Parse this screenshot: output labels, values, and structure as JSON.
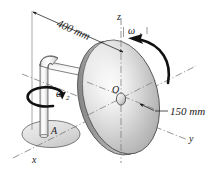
{
  "figure": {
    "dimensions": {
      "arm_length": "400 mm",
      "disk_radius": "150 mm"
    },
    "angular_velocities": {
      "disk_spin": "ω",
      "disk_spin_sub": "1",
      "shaft_spin": "ω",
      "shaft_spin_sub": "2"
    },
    "points": {
      "disk_center": "O",
      "base_point": "A"
    },
    "axes": {
      "x": "x",
      "y": "y",
      "z": "z"
    },
    "colors": {
      "line": "#1a1a1a",
      "disk_light": "#f2f2f2",
      "disk_mid": "#c8c8c8",
      "disk_dark": "#8f8f8f",
      "rim": "#9a9a9a",
      "base": "#dcdcdc",
      "arm": "#ededed",
      "centerline": "#7a7a7a",
      "background": "#ffffff"
    }
  }
}
